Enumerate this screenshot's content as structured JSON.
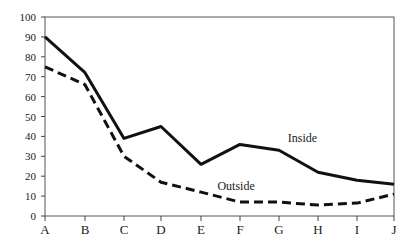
{
  "chart_data": {
    "type": "line",
    "title": "",
    "xlabel": "",
    "ylabel": "",
    "categories": [
      "A",
      "B",
      "C",
      "D",
      "E",
      "F",
      "G",
      "H",
      "I",
      "J"
    ],
    "ylim": [
      0,
      100
    ],
    "yticks": [
      0,
      10,
      20,
      30,
      40,
      50,
      60,
      70,
      80,
      90,
      100
    ],
    "grid": false,
    "legend": "inline labels",
    "series": [
      {
        "name": "Inside",
        "style": "solid",
        "values": [
          90,
          72,
          39,
          45,
          26,
          36,
          33,
          22,
          18,
          16
        ]
      },
      {
        "name": "Outside",
        "style": "dashed",
        "values": [
          75,
          66,
          30,
          17,
          12,
          7,
          7,
          5.5,
          6.5,
          11
        ]
      }
    ],
    "annotations": [
      {
        "text": "Inside",
        "category_index": 6.6,
        "value": 37
      },
      {
        "text": "Outside",
        "category_index": 4.9,
        "value": 13
      }
    ]
  },
  "colors": {
    "line": "#111111",
    "axis": "#444444",
    "background": "#ffffff"
  }
}
